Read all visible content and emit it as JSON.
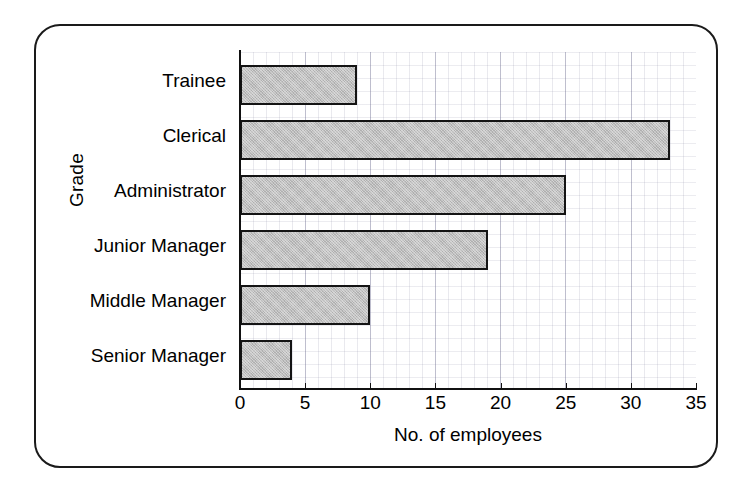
{
  "figure": {
    "frame_color": "#1a1a1a",
    "background": "#ffffff"
  },
  "chart_data": {
    "type": "bar",
    "orientation": "horizontal",
    "title": "",
    "subtitle": "",
    "xlabel": "No. of employees",
    "ylabel": "Grade",
    "categories": [
      "Trainee",
      "Clerical",
      "Administrator",
      "Junior Manager",
      "Middle Manager",
      "Senior Manager"
    ],
    "values": [
      9,
      33,
      25,
      19,
      10,
      4
    ],
    "xlim": [
      0,
      35
    ],
    "xticks": [
      0,
      5,
      10,
      15,
      20,
      25,
      30,
      35
    ],
    "xtick_labels": [
      "0",
      "5",
      "10",
      "15",
      "20",
      "25",
      "30",
      "35"
    ],
    "grid": true,
    "legend": false,
    "bar_fill_color": "#bfbfbf",
    "bar_edge_color": "#141414"
  }
}
